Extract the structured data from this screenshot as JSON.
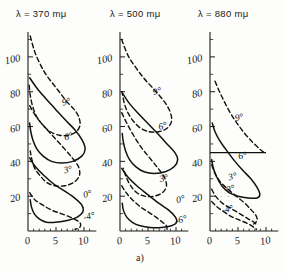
{
  "figure": {
    "caption": "a)",
    "panel_titles": [
      "λ = 370 mμ",
      "λ = 500 mμ",
      "λ = 880 mμ"
    ]
  },
  "chart_data": {
    "type": "line",
    "title": "a)",
    "xlabel": "",
    "ylabel": "",
    "xlim": [
      0,
      12
    ],
    "ylim": [
      0,
      112
    ],
    "xticks": [
      0,
      5,
      10
    ],
    "xticklabels": [
      "0",
      "5",
      "10"
    ],
    "yticks": [
      0,
      20,
      40,
      60,
      80,
      100
    ],
    "yticklabels": [
      "0",
      "20",
      "40",
      "60",
      "80",
      "100"
    ],
    "minor_ytick_step": 10,
    "grid": false,
    "legend": "inline-curve-labels",
    "panels": [
      {
        "title": "λ = 370 mμ",
        "curves": [
          {
            "label": "9°",
            "style": "dashed",
            "label_xy": [
              6.2,
              72
            ],
            "points": [
              [
                0.4,
                112
              ],
              [
                1.2,
                103
              ],
              [
                2.3,
                95
              ],
              [
                3.4,
                89
              ],
              [
                4.6,
                84
              ],
              [
                5.8,
                79
              ],
              [
                7.0,
                74
              ],
              [
                8.2,
                70
              ],
              [
                9.0,
                66
              ],
              [
                9.3,
                61
              ],
              [
                8.6,
                57
              ],
              [
                7.2,
                55
              ],
              [
                5.6,
                55
              ],
              [
                4.0,
                57
              ],
              [
                2.6,
                61
              ],
              [
                1.5,
                66
              ],
              [
                0.8,
                72
              ],
              [
                0.4,
                78
              ],
              [
                0.2,
                84
              ]
            ]
          },
          {
            "label": "6°",
            "style": "solid",
            "label_xy": [
              6.6,
              52
            ],
            "points": [
              [
                0.3,
                88
              ],
              [
                1.6,
                82
              ],
              [
                3.2,
                76
              ],
              [
                4.9,
                70
              ],
              [
                6.6,
                64
              ],
              [
                8.4,
                58
              ],
              [
                9.7,
                52
              ],
              [
                10.2,
                47
              ],
              [
                9.6,
                43
              ],
              [
                8.0,
                40
              ],
              [
                6.0,
                39
              ],
              [
                4.2,
                40
              ],
              [
                2.7,
                43
              ],
              [
                1.6,
                47
              ],
              [
                0.9,
                52
              ],
              [
                0.5,
                57
              ],
              [
                0.3,
                62
              ]
            ]
          },
          {
            "label": "3°",
            "style": "dashed",
            "label_xy": [
              6.5,
              33
            ],
            "points": [
              [
                0.3,
                72
              ],
              [
                1.4,
                66
              ],
              [
                2.9,
                60
              ],
              [
                4.6,
                54
              ],
              [
                6.3,
                48
              ],
              [
                7.9,
                42
              ],
              [
                9.0,
                37
              ],
              [
                9.2,
                32
              ],
              [
                8.2,
                28
              ],
              [
                6.6,
                26
              ],
              [
                4.8,
                26
              ],
              [
                3.3,
                28
              ],
              [
                2.1,
                32
              ],
              [
                1.2,
                36
              ],
              [
                0.7,
                41
              ],
              [
                0.4,
                46
              ]
            ]
          },
          {
            "label": "0°",
            "style": "solid",
            "label_xy": [
              10.0,
              19
            ],
            "points": [
              [
                0.3,
                42
              ],
              [
                1.3,
                37
              ],
              [
                2.8,
                32
              ],
              [
                4.6,
                27
              ],
              [
                6.5,
                23
              ],
              [
                8.3,
                19
              ],
              [
                9.6,
                15
              ],
              [
                9.8,
                11
              ],
              [
                8.8,
                8
              ],
              [
                7.0,
                6
              ],
              [
                5.0,
                5
              ],
              [
                3.3,
                5
              ],
              [
                2.0,
                7
              ],
              [
                1.1,
                10
              ],
              [
                0.6,
                14
              ],
              [
                0.4,
                18
              ]
            ]
          },
          {
            "label": "-4°",
            "style": "dashed",
            "label_xy": [
              10.0,
              6
            ],
            "points": [
              [
                0.3,
                22
              ],
              [
                1.2,
                18
              ],
              [
                2.6,
                15
              ],
              [
                4.2,
                12
              ],
              [
                5.9,
                10
              ],
              [
                7.5,
                8
              ],
              [
                8.8,
                6
              ],
              [
                9.4,
                4
              ],
              [
                9.2,
                2
              ],
              [
                8.4,
                1
              ]
            ]
          }
        ]
      },
      {
        "title": "λ = 500 mμ",
        "curves": [
          {
            "label": "9°",
            "style": "dashed",
            "label_xy": [
              6.0,
              78
            ],
            "points": [
              [
                0.3,
                110
              ],
              [
                1.4,
                101
              ],
              [
                2.8,
                94
              ],
              [
                4.2,
                88
              ],
              [
                5.6,
                83
              ],
              [
                7.0,
                78
              ],
              [
                8.2,
                73
              ],
              [
                9.0,
                68
              ],
              [
                9.2,
                63
              ],
              [
                8.4,
                59
              ],
              [
                6.9,
                57
              ],
              [
                5.2,
                57
              ],
              [
                3.7,
                59
              ],
              [
                2.4,
                63
              ],
              [
                1.4,
                68
              ],
              [
                0.8,
                73
              ],
              [
                0.4,
                79
              ]
            ]
          },
          {
            "label": "6°",
            "style": "solid",
            "label_xy": [
              7.0,
              58
            ],
            "points": [
              [
                0.3,
                80
              ],
              [
                1.5,
                74
              ],
              [
                3.1,
                68
              ],
              [
                4.9,
                62
              ],
              [
                6.7,
                56
              ],
              [
                8.4,
                50
              ],
              [
                9.8,
                45
              ],
              [
                10.3,
                41
              ],
              [
                9.7,
                37
              ],
              [
                8.1,
                34
              ],
              [
                6.1,
                33
              ],
              [
                4.3,
                34
              ],
              [
                2.8,
                37
              ],
              [
                1.7,
                41
              ],
              [
                1.0,
                46
              ],
              [
                0.6,
                51
              ],
              [
                0.4,
                56
              ]
            ]
          },
          {
            "label": "3°",
            "style": "dashed",
            "label_xy": [
              7.2,
              28
            ],
            "points": [
              [
                0.3,
                68
              ],
              [
                1.2,
                62
              ],
              [
                2.4,
                55
              ],
              [
                3.8,
                48
              ],
              [
                5.3,
                42
              ],
              [
                6.8,
                36
              ],
              [
                7.9,
                31
              ],
              [
                8.3,
                26
              ],
              [
                7.6,
                22
              ],
              [
                6.1,
                20
              ],
              [
                4.4,
                20
              ],
              [
                3.0,
                22
              ],
              [
                1.9,
                26
              ],
              [
                1.1,
                31
              ],
              [
                0.6,
                36
              ]
            ]
          },
          {
            "label": "0°",
            "style": "solid",
            "label_xy": [
              10.2,
              16
            ],
            "points": [
              [
                0.3,
                36
              ],
              [
                1.4,
                31
              ],
              [
                3.0,
                26
              ],
              [
                4.9,
                21
              ],
              [
                6.9,
                16
              ],
              [
                8.7,
                12
              ],
              [
                9.9,
                8
              ],
              [
                10.1,
                5
              ],
              [
                9.2,
                3
              ],
              [
                7.4,
                2
              ],
              [
                5.4,
                2
              ],
              [
                3.6,
                3
              ],
              [
                2.2,
                5
              ],
              [
                1.2,
                8
              ],
              [
                0.6,
                12
              ],
              [
                0.4,
                16
              ]
            ]
          },
          {
            "label": "-6°",
            "style": "dashed",
            "label_xy": [
              10.0,
              4
            ],
            "points": [
              [
                0.3,
                26
              ],
              [
                1.1,
                22
              ],
              [
                2.2,
                18
              ],
              [
                3.6,
                14
              ],
              [
                5.0,
                11
              ],
              [
                6.4,
                8
              ],
              [
                7.6,
                5
              ],
              [
                8.3,
                3
              ],
              [
                8.4,
                1
              ]
            ]
          }
        ]
      },
      {
        "title": "λ = 880 mμ",
        "baseline_y": 45,
        "curves": [
          {
            "label": "9°",
            "style": "dashed",
            "label_xy": [
              4.6,
              63
            ],
            "points": [
              [
                0.9,
                86
              ],
              [
                1.7,
                80
              ],
              [
                2.6,
                74
              ],
              [
                3.6,
                68
              ],
              [
                4.8,
                62
              ],
              [
                6.2,
                56
              ],
              [
                7.6,
                51
              ],
              [
                8.9,
                47
              ],
              [
                9.7,
                45
              ]
            ]
          },
          {
            "label": "6°",
            "style": "solid",
            "label_xy": [
              5.2,
              41
            ],
            "points": [
              [
                0.4,
                62
              ],
              [
                0.9,
                57
              ],
              [
                1.7,
                52
              ],
              [
                2.8,
                47
              ],
              [
                4.2,
                41
              ],
              [
                5.8,
                35
              ],
              [
                7.3,
                30
              ],
              [
                8.4,
                25
              ],
              [
                8.9,
                21
              ],
              [
                8.4,
                19
              ],
              [
                6.8,
                19
              ],
              [
                5.0,
                20
              ],
              [
                3.4,
                22
              ],
              [
                2.1,
                26
              ],
              [
                1.2,
                31
              ],
              [
                0.6,
                36
              ],
              [
                0.3,
                41
              ]
            ]
          },
          {
            "label": "3°",
            "style": "dashed",
            "label_xy": [
              3.4,
              29
            ],
            "points": [
              [
                0.3,
                38
              ],
              [
                0.9,
                33
              ],
              [
                1.9,
                28
              ],
              [
                3.2,
                24
              ],
              [
                4.7,
                20
              ],
              [
                6.2,
                16
              ],
              [
                7.4,
                12
              ],
              [
                8.2,
                9
              ],
              [
                8.4,
                6
              ],
              [
                7.8,
                4
              ]
            ]
          },
          {
            "label": "0°",
            "style": "dashed",
            "label_xy": [
              3.0,
              22
            ],
            "points": [
              [
                0.3,
                24
              ],
              [
                1.0,
                20
              ],
              [
                2.2,
                16
              ],
              [
                3.7,
                13
              ],
              [
                5.3,
                10
              ],
              [
                6.8,
                7
              ],
              [
                7.9,
                5
              ],
              [
                8.4,
                3
              ]
            ]
          },
          {
            "label": "-4°",
            "style": "dashed",
            "label_xy": [
              2.2,
              10
            ],
            "points": [
              [
                0.3,
                17
              ],
              [
                1.2,
                14
              ],
              [
                2.5,
                11
              ],
              [
                4.0,
                8
              ],
              [
                5.5,
                6
              ],
              [
                6.9,
                4
              ],
              [
                7.9,
                2
              ],
              [
                8.3,
                1
              ]
            ]
          }
        ],
        "hatched_regions": [
          {
            "name": "upper-shaded-9deg",
            "top_curve": "9°",
            "baseline_y": 45
          },
          {
            "name": "lower-shaded-6deg",
            "top_curve": "6°",
            "baseline_y": 20
          }
        ]
      }
    ]
  }
}
